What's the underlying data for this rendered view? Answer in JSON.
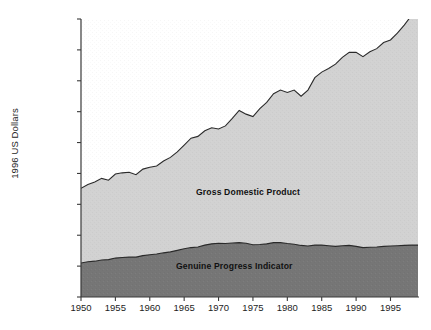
{
  "chart_data": {
    "type": "area",
    "title": "",
    "subtitle": "",
    "xlabel": "",
    "ylabel": "1996 US Dollars",
    "stacked": true,
    "grid": false,
    "legend_position": "in-plot-annotations",
    "xlim": [
      1950,
      1999
    ],
    "ylim": [
      0,
      45000
    ],
    "xticks": [
      "1950",
      "1955",
      "1960",
      "1965",
      "1970",
      "1975",
      "1980",
      "1985",
      "1990",
      "1995"
    ],
    "xtick_values": [
      1950,
      1955,
      1960,
      1965,
      1970,
      1975,
      1980,
      1985,
      1990,
      1995
    ],
    "yticks": [
      "0",
      "5,000",
      "10,000",
      "15,000",
      "20,000",
      "25,000",
      "30,000",
      "35,000",
      "40,000",
      "45,000"
    ],
    "ytick_values": [
      0,
      5000,
      10000,
      15000,
      20000,
      25000,
      30000,
      35000,
      40000,
      45000
    ],
    "x": [
      1950,
      1951,
      1952,
      1953,
      1954,
      1955,
      1956,
      1957,
      1958,
      1959,
      1960,
      1961,
      1962,
      1963,
      1964,
      1965,
      1966,
      1967,
      1968,
      1969,
      1970,
      1971,
      1972,
      1973,
      1974,
      1975,
      1976,
      1977,
      1978,
      1979,
      1980,
      1981,
      1982,
      1983,
      1984,
      1985,
      1986,
      1987,
      1988,
      1989,
      1990,
      1991,
      1992,
      1993,
      1994,
      1995,
      1996,
      1997,
      1998,
      1999
    ],
    "series": [
      {
        "name": "Genuine Progress Indicator",
        "color": "#767676",
        "values": [
          5500,
          5700,
          5800,
          6000,
          6050,
          6300,
          6400,
          6450,
          6450,
          6700,
          6850,
          6950,
          7150,
          7300,
          7550,
          7800,
          8000,
          8100,
          8400,
          8600,
          8700,
          8650,
          8750,
          8800,
          8700,
          8450,
          8500,
          8600,
          8800,
          8800,
          8650,
          8550,
          8350,
          8250,
          8400,
          8400,
          8300,
          8200,
          8300,
          8350,
          8200,
          8000,
          8050,
          8100,
          8200,
          8250,
          8300,
          8350,
          8400,
          8400
        ]
      },
      {
        "name": "Gross Domestic Product",
        "color": "#d2d2d2",
        "values": [
          17600,
          18200,
          18600,
          19200,
          18900,
          19900,
          20100,
          20200,
          19800,
          20700,
          21000,
          21200,
          22000,
          22600,
          23500,
          24600,
          25700,
          26000,
          26900,
          27400,
          27200,
          27700,
          28900,
          30200,
          29600,
          29200,
          30500,
          31500,
          32900,
          33500,
          33100,
          33500,
          32500,
          33500,
          35500,
          36400,
          37000,
          37700,
          38800,
          39600,
          39600,
          38900,
          39700,
          40200,
          41200,
          41600,
          42700,
          44000,
          45500,
          47300
        ]
      }
    ]
  },
  "axis": {
    "y_title": "1996 US Dollars"
  },
  "annotations": {
    "gdp_label": "Gross Domestic Product",
    "gpi_label": "Genuine Progress Indicator"
  },
  "colors": {
    "gdp_fill": "#d2d2d2",
    "gpi_fill": "#767676",
    "line": "#2a2a2a",
    "axis": "#3a3a3a",
    "background": "#ffffff",
    "text": "#1d1d1d"
  }
}
